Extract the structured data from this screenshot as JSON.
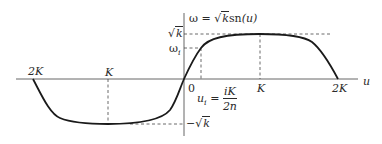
{
  "diagram": {
    "title_formula": {
      "lhs": "ω",
      "eq": "=",
      "sqrt_symbol": "√",
      "sqrt_arg": "k",
      "func": "sn",
      "arg": "(u)"
    },
    "axes": {
      "horizontal_label": "u",
      "origin_label": "0"
    },
    "x_ticks": {
      "left_2K": "2K",
      "left_K": "K",
      "right_K": "K",
      "right_2K": "2K"
    },
    "y_ticks": {
      "sqrt_k": {
        "sym": "√",
        "arg": "k"
      },
      "omega_i": {
        "base": "ω",
        "sub": "i"
      },
      "neg_sqrt_k": {
        "minus": "−",
        "sym": "√",
        "arg": "k"
      }
    },
    "u_i_annotation": {
      "lhs_base": "u",
      "lhs_sub": "i",
      "eq": "=",
      "numerator": "iK",
      "denominator": "2n"
    },
    "colors": {
      "curve": "#1a1a1a",
      "axis": "#555555",
      "dashed": "#444444",
      "text": "#2a2a2a"
    }
  }
}
